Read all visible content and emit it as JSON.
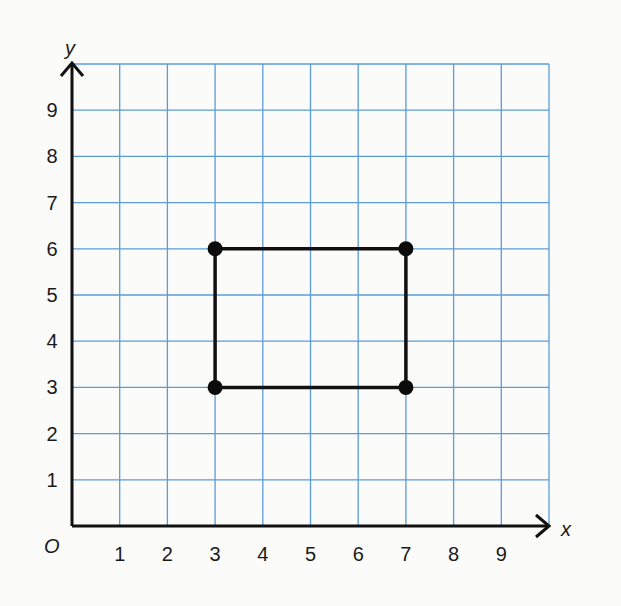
{
  "chart_data": {
    "type": "scatter",
    "title": "",
    "xlabel": "x",
    "ylabel": "y",
    "origin_label": "O",
    "xlim": [
      0,
      10
    ],
    "ylim": [
      0,
      10
    ],
    "grid": true,
    "x_ticks": [
      1,
      2,
      3,
      4,
      5,
      6,
      7,
      8,
      9
    ],
    "y_ticks": [
      1,
      2,
      3,
      4,
      5,
      6,
      7,
      8,
      9
    ],
    "points": [
      {
        "x": 3,
        "y": 6
      },
      {
        "x": 7,
        "y": 6
      },
      {
        "x": 7,
        "y": 3
      },
      {
        "x": 3,
        "y": 3
      }
    ],
    "polygon": {
      "closed": true,
      "description": "rectangle connecting the four points",
      "vertices": [
        [
          3,
          6
        ],
        [
          7,
          6
        ],
        [
          7,
          3
        ],
        [
          3,
          3
        ]
      ]
    },
    "colors": {
      "grid": "#5b9bd8",
      "axes": "#111111",
      "shape": "#111111",
      "points": "#0b0b0b"
    }
  }
}
